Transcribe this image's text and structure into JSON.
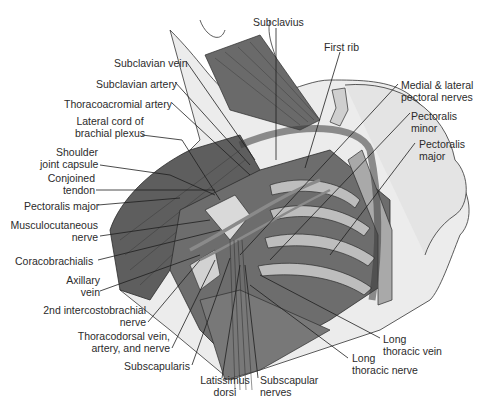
{
  "figure": {
    "colors": {
      "background": "#ffffff",
      "muscle_dark": "#5a5a5a",
      "muscle_mid": "#7c7c7c",
      "bone_light": "#c9c9c9",
      "skin": "#ebebeb",
      "leader": "#1e1e1e",
      "text": "#2b2b2b"
    }
  },
  "labels": {
    "subclavius": "Subclavius",
    "first_rib": "First rib",
    "subclavian_vein": "Subclavian vein",
    "subclavian_artery": "Subclavian artery",
    "thoracoacromial_artery": "Thoracoacromial artery",
    "lateral_cord_1": "Lateral cord of",
    "lateral_cord_2": "brachial plexus",
    "shoulder_capsule_1": "Shoulder",
    "shoulder_capsule_2": "joint capsule",
    "conjoined_tendon_1": "Conjoined",
    "conjoined_tendon_2": "tendon",
    "pectoralis_major_left": "Pectoralis major",
    "musculocutaneous_1": "Musculocutaneous",
    "musculocutaneous_2": "nerve",
    "coracobrachialis": "Coracobrachialis",
    "axillary_vein_1": "Axillary",
    "axillary_vein_2": "vein",
    "intercostobrachial_1": "2nd intercostobrachial",
    "intercostobrachial_2": "nerve",
    "thoracodorsal_1": "Thoracodorsal vein,",
    "thoracodorsal_2": "artery, and nerve",
    "subscapularis": "Subscapularis",
    "latissimus_1": "Latissimus",
    "latissimus_2": "dorsi",
    "subscapular_nerves_1": "Subscapular",
    "subscapular_nerves_2": "nerves",
    "long_thoracic_nerve_1": "Long",
    "long_thoracic_nerve_2": "thoracic nerve",
    "long_thoracic_vein_1": "Long",
    "long_thoracic_vein_2": "thoracic vein",
    "pectoral_nerves_1": "Medial & lateral",
    "pectoral_nerves_2": "pectoral nerves",
    "pectoralis_minor_1": "Pectoralis",
    "pectoralis_minor_2": "minor",
    "pectoralis_major_right_1": "Pectoralis",
    "pectoralis_major_right_2": "major"
  }
}
